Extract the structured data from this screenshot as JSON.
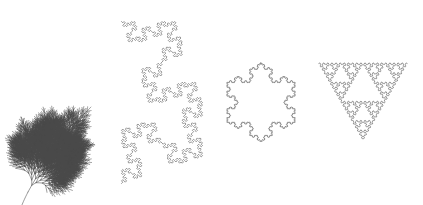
{
  "page": {
    "background_color": "#ffffff",
    "width": 423,
    "height": 205
  },
  "style": {
    "stroke_color": "#5a5a5a",
    "plant_stroke_color": "#4a4a4a",
    "stroke_width": 0.7,
    "plant_stroke_width": 0.55
  },
  "figures": [
    {
      "name": "plant-branch",
      "label": "Branching plant / fern frond",
      "type": "botanical-line-drawing",
      "x": 8,
      "y": 6,
      "width": 104,
      "height": 194,
      "stroke": "#4a4a4a",
      "stroke_width": 0.55,
      "params": {
        "iterations": 5,
        "branch_angle_deg": 26,
        "length_ratio": 0.72,
        "trunk_length": 46,
        "trunk_angle_deg": -62,
        "curvature": 0.22,
        "seed": 7
      }
    },
    {
      "name": "quadratic-koch-island",
      "label": "Quadratic (Minkowski) Koch island",
      "type": "square-koch-curve",
      "x": 116,
      "y": 12,
      "width": 92,
      "height": 181,
      "stroke": "#5a5a5a",
      "stroke_width": 0.7,
      "params": {
        "iterations": 3,
        "generator": "square-koch-8-segment",
        "base_shape": "open-wedge",
        "cell": 6
      }
    },
    {
      "name": "koch-snowflake",
      "label": "Koch snowflake",
      "type": "koch-snowflake",
      "x": 212,
      "y": 44,
      "width": 98,
      "height": 113,
      "stroke": "#5a5a5a",
      "stroke_width": 0.7,
      "params": {
        "iterations": 4,
        "sides": 3,
        "generator": "koch-4-segment-60deg"
      }
    },
    {
      "name": "sierpinski-arrowhead-lobed",
      "label": "Sierpinski triangle drawn with a lobed (terdragon) curve",
      "type": "sierpinski-lobed-curve",
      "x": 316,
      "y": 36,
      "width": 94,
      "height": 130,
      "stroke": "#5a5a5a",
      "stroke_width": 0.7,
      "params": {
        "iterations": 4,
        "generator": "terdragon-lobe",
        "orientation": "apex-left"
      }
    }
  ]
}
